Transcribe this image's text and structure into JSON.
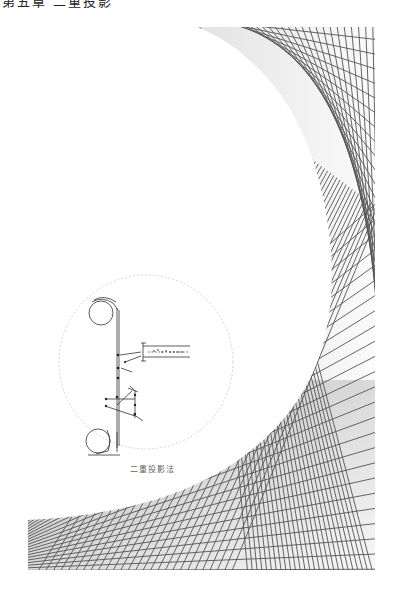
{
  "page": {
    "header_text": "第五章 二重投影",
    "illustration": {
      "caption": "二重投影法",
      "inset_circle": {
        "cx": 146,
        "cy": 362,
        "r": 87,
        "stroke": "#c8c8c8"
      },
      "mesh": {
        "stroke": "#555555",
        "shade_dark": "#8a8a8a",
        "shade_light": "#ffffff"
      }
    }
  }
}
